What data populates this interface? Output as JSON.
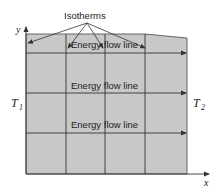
{
  "title_label": "Isotherms",
  "flow_labels": [
    "Energy flow line",
    "Energy flow line",
    "Energy flow line"
  ],
  "left_temperature": {
    "symbol": "T",
    "subscript": "1"
  },
  "right_temperature": {
    "symbol": "T",
    "subscript": "2"
  },
  "axes": {
    "x": "x",
    "y": "y"
  },
  "colors": {
    "region_fill": "#c8c8c8",
    "line": "#333333"
  }
}
